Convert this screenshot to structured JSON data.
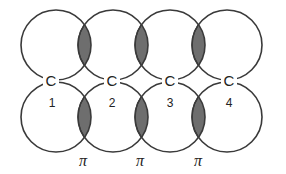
{
  "diagram": {
    "atoms": [
      {
        "symbol": "C",
        "number": "1"
      },
      {
        "symbol": "C",
        "number": "2"
      },
      {
        "symbol": "C",
        "number": "3"
      },
      {
        "symbol": "C",
        "number": "4"
      }
    ],
    "bond_labels": [
      "π",
      "π",
      "π"
    ],
    "colors": {
      "outline": "#3a3a3a",
      "overlap_fill": "#6e6e6e",
      "background": "#ffffff"
    }
  }
}
